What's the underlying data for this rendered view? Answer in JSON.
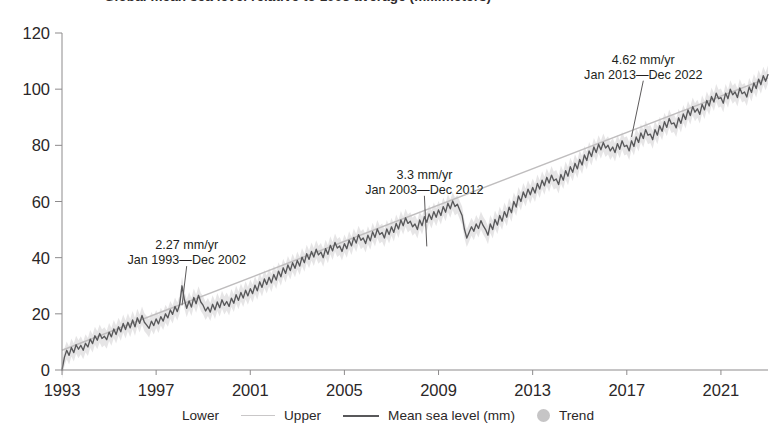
{
  "chart_data": {
    "type": "line",
    "title": "Global mean sea level relative to 1993 average (millimeters)",
    "xlabel": "",
    "ylabel": "",
    "xlim": [
      1993,
      2023
    ],
    "ylim": [
      0,
      120
    ],
    "yticks": [
      0,
      20,
      40,
      60,
      80,
      100,
      120
    ],
    "xticks": [
      1993,
      1997,
      2001,
      2005,
      2009,
      2013,
      2017,
      2021
    ],
    "grid": false,
    "legend_position": "bottom",
    "legend": [
      {
        "name": "Lower",
        "marker": "none",
        "color": "#d8d6d7"
      },
      {
        "name": "Upper",
        "marker": "line",
        "color": "#c9c7c8"
      },
      {
        "name": "Mean sea level (mm)",
        "marker": "line-thick",
        "color": "#58585a"
      },
      {
        "name": "Trend",
        "marker": "dot",
        "color": "#c6c5c6"
      }
    ],
    "annotations": [
      {
        "rate": "2.27 mm/yr",
        "span": "Jan 1993—Dec 2002",
        "text_x": 1998.3,
        "text_y": 42,
        "point_x": 1998.1,
        "point_y": 23
      },
      {
        "rate": "3.3 mm/yr",
        "span": "Jan 2003—Dec 2012",
        "text_x": 2008.4,
        "text_y": 67,
        "point_x": 2008.5,
        "point_y": 44
      },
      {
        "rate": "4.62 mm/yr",
        "span": "Jan 2013—Dec 2022",
        "text_x": 2017.7,
        "text_y": 108,
        "point_x": 2017.2,
        "point_y": 83
      }
    ],
    "series": [
      {
        "name": "Mean sea level (mm)",
        "color": "#58585a",
        "x": [
          1993.0,
          1993.1,
          1993.2,
          1993.3,
          1993.4,
          1993.5,
          1993.6,
          1993.7,
          1993.8,
          1993.9,
          1994.0,
          1994.1,
          1994.2,
          1994.3,
          1994.4,
          1994.5,
          1994.6,
          1994.7,
          1994.8,
          1994.9,
          1995.0,
          1995.1,
          1995.2,
          1995.3,
          1995.4,
          1995.5,
          1995.6,
          1995.7,
          1995.8,
          1995.9,
          1996.0,
          1996.1,
          1996.2,
          1996.3,
          1996.4,
          1996.5,
          1996.6,
          1996.7,
          1996.8,
          1996.9,
          1997.0,
          1997.1,
          1997.2,
          1997.3,
          1997.4,
          1997.5,
          1997.6,
          1997.7,
          1997.8,
          1997.9,
          1998.0,
          1998.1,
          1998.2,
          1998.3,
          1998.4,
          1998.5,
          1998.6,
          1998.7,
          1998.8,
          1998.9,
          1999.0,
          1999.1,
          1999.2,
          1999.3,
          1999.4,
          1999.5,
          1999.6,
          1999.7,
          1999.8,
          1999.9,
          2000.0,
          2000.1,
          2000.2,
          2000.3,
          2000.4,
          2000.5,
          2000.6,
          2000.7,
          2000.8,
          2000.9,
          2001.0,
          2001.1,
          2001.2,
          2001.3,
          2001.4,
          2001.5,
          2001.6,
          2001.7,
          2001.8,
          2001.9,
          2002.0,
          2002.1,
          2002.2,
          2002.3,
          2002.4,
          2002.5,
          2002.6,
          2002.7,
          2002.8,
          2002.9,
          2003.0,
          2003.1,
          2003.2,
          2003.3,
          2003.4,
          2003.5,
          2003.6,
          2003.7,
          2003.8,
          2003.9,
          2004.0,
          2004.1,
          2004.2,
          2004.3,
          2004.4,
          2004.5,
          2004.6,
          2004.7,
          2004.8,
          2004.9,
          2005.0,
          2005.1,
          2005.2,
          2005.3,
          2005.4,
          2005.5,
          2005.6,
          2005.7,
          2005.8,
          2005.9,
          2006.0,
          2006.1,
          2006.2,
          2006.3,
          2006.4,
          2006.5,
          2006.6,
          2006.7,
          2006.8,
          2006.9,
          2007.0,
          2007.1,
          2007.2,
          2007.3,
          2007.4,
          2007.5,
          2007.6,
          2007.7,
          2007.8,
          2007.9,
          2008.0,
          2008.1,
          2008.2,
          2008.3,
          2008.4,
          2008.5,
          2008.6,
          2008.7,
          2008.8,
          2008.9,
          2009.0,
          2009.1,
          2009.2,
          2009.3,
          2009.4,
          2009.5,
          2009.6,
          2009.7,
          2009.8,
          2009.9,
          2010.0,
          2010.1,
          2010.2,
          2010.3,
          2010.4,
          2010.5,
          2010.6,
          2010.7,
          2010.8,
          2010.9,
          2011.0,
          2011.1,
          2011.2,
          2011.3,
          2011.4,
          2011.5,
          2011.6,
          2011.7,
          2011.8,
          2011.9,
          2012.0,
          2012.1,
          2012.2,
          2012.3,
          2012.4,
          2012.5,
          2012.6,
          2012.7,
          2012.8,
          2012.9,
          2013.0,
          2013.1,
          2013.2,
          2013.3,
          2013.4,
          2013.5,
          2013.6,
          2013.7,
          2013.8,
          2013.9,
          2014.0,
          2014.1,
          2014.2,
          2014.3,
          2014.4,
          2014.5,
          2014.6,
          2014.7,
          2014.8,
          2014.9,
          2015.0,
          2015.1,
          2015.2,
          2015.3,
          2015.4,
          2015.5,
          2015.6,
          2015.7,
          2015.8,
          2015.9,
          2016.0,
          2016.1,
          2016.2,
          2016.3,
          2016.4,
          2016.5,
          2016.6,
          2016.7,
          2016.8,
          2016.9,
          2017.0,
          2017.1,
          2017.2,
          2017.3,
          2017.4,
          2017.5,
          2017.6,
          2017.7,
          2017.8,
          2017.9,
          2018.0,
          2018.1,
          2018.2,
          2018.3,
          2018.4,
          2018.5,
          2018.6,
          2018.7,
          2018.8,
          2018.9,
          2019.0,
          2019.1,
          2019.2,
          2019.3,
          2019.4,
          2019.5,
          2019.6,
          2019.7,
          2019.8,
          2019.9,
          2020.0,
          2020.1,
          2020.2,
          2020.3,
          2020.4,
          2020.5,
          2020.6,
          2020.7,
          2020.8,
          2020.9,
          2021.0,
          2021.1,
          2021.2,
          2021.3,
          2021.4,
          2021.5,
          2021.6,
          2021.7,
          2021.8,
          2021.9,
          2022.0,
          2022.1,
          2022.2,
          2022.3,
          2022.4,
          2022.5,
          2022.6,
          2022.7,
          2022.8,
          2022.9,
          2023.0
        ],
        "y": [
          0.0,
          4.5,
          7.0,
          5.2,
          8.0,
          6.2,
          9.0,
          7.4,
          8.8,
          7.0,
          9.5,
          8.2,
          11.0,
          9.4,
          12.2,
          10.6,
          13.0,
          11.2,
          12.0,
          10.8,
          13.5,
          11.8,
          14.6,
          12.6,
          15.4,
          13.6,
          16.6,
          14.4,
          17.0,
          15.0,
          17.8,
          15.4,
          18.6,
          16.6,
          19.4,
          17.0,
          16.0,
          14.8,
          17.4,
          15.8,
          18.2,
          16.4,
          19.0,
          17.4,
          20.0,
          18.6,
          21.4,
          19.8,
          22.6,
          20.8,
          23.4,
          30.0,
          25.0,
          22.0,
          24.6,
          22.4,
          25.8,
          23.6,
          26.6,
          24.2,
          23.0,
          21.0,
          22.4,
          20.6,
          23.4,
          21.4,
          24.2,
          22.2,
          25.0,
          23.0,
          24.4,
          22.6,
          25.6,
          23.8,
          26.8,
          24.8,
          27.6,
          25.6,
          28.4,
          26.4,
          29.0,
          27.2,
          30.2,
          28.2,
          31.4,
          29.4,
          32.4,
          30.4,
          33.0,
          31.0,
          34.0,
          32.0,
          35.2,
          33.2,
          36.4,
          34.4,
          37.4,
          35.4,
          38.2,
          36.2,
          39.0,
          37.0,
          40.2,
          38.2,
          41.4,
          39.4,
          42.2,
          40.2,
          43.0,
          41.0,
          42.0,
          40.0,
          43.2,
          41.2,
          44.4,
          42.4,
          45.4,
          43.4,
          44.2,
          42.2,
          45.0,
          43.2,
          46.2,
          44.2,
          47.2,
          45.2,
          48.2,
          46.2,
          47.0,
          45.0,
          48.0,
          46.0,
          49.2,
          47.2,
          50.2,
          48.2,
          49.0,
          47.0,
          50.2,
          48.2,
          51.0,
          49.0,
          52.2,
          50.2,
          53.4,
          51.4,
          54.2,
          52.2,
          53.0,
          51.0,
          52.0,
          50.0,
          53.4,
          51.4,
          54.6,
          52.6,
          55.6,
          53.6,
          56.4,
          54.4,
          57.0,
          55.0,
          58.2,
          56.2,
          59.4,
          57.4,
          60.2,
          58.2,
          59.0,
          57.0,
          55.0,
          50.2,
          47.0,
          49.0,
          51.0,
          49.4,
          52.0,
          50.4,
          53.2,
          51.4,
          50.0,
          48.0,
          52.0,
          50.0,
          53.6,
          51.6,
          55.0,
          53.0,
          56.4,
          54.4,
          58.0,
          56.0,
          60.0,
          58.0,
          62.0,
          60.0,
          63.4,
          61.4,
          64.4,
          62.4,
          65.0,
          63.0,
          66.4,
          64.4,
          67.6,
          65.6,
          68.6,
          66.6,
          69.4,
          67.4,
          68.0,
          66.0,
          69.6,
          67.6,
          71.0,
          69.0,
          72.4,
          70.4,
          73.6,
          71.6,
          75.0,
          73.0,
          76.6,
          74.6,
          78.0,
          76.0,
          79.4,
          77.4,
          80.4,
          78.4,
          81.0,
          79.0,
          80.0,
          78.0,
          79.4,
          77.4,
          80.6,
          78.6,
          81.6,
          79.6,
          80.0,
          78.0,
          81.6,
          79.6,
          83.0,
          81.0,
          84.4,
          82.4,
          85.6,
          83.6,
          84.0,
          82.0,
          85.6,
          83.6,
          87.0,
          85.0,
          88.4,
          86.4,
          89.6,
          87.6,
          88.0,
          86.2,
          89.8,
          87.8,
          91.2,
          89.2,
          92.6,
          90.6,
          93.8,
          91.8,
          93.0,
          91.0,
          94.6,
          92.6,
          96.0,
          94.0,
          97.4,
          95.4,
          98.6,
          96.6,
          97.0,
          95.0,
          98.6,
          96.6,
          100.0,
          98.0,
          99.0,
          97.0,
          100.4,
          98.4,
          99.0,
          97.2,
          100.8,
          98.8,
          102.2,
          100.2,
          103.6,
          101.6,
          104.8,
          102.8,
          105.2
        ]
      }
    ],
    "trend_line": {
      "name": "Trend",
      "color": "#bfbdbe",
      "x0": 1993,
      "y0": 7,
      "x1": 2023,
      "y1": 104
    },
    "band": {
      "lower_name": "Lower",
      "upper_name": "Upper",
      "color": "#e3e2e3",
      "half_width": 3.2
    }
  }
}
